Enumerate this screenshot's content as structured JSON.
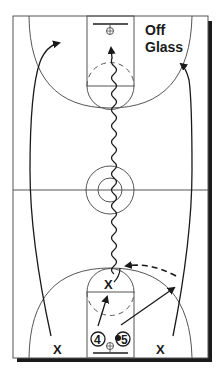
{
  "diagram": {
    "type": "basketball-half-court-drill",
    "title_line1": "Off",
    "title_line2": "Glass",
    "colors": {
      "court_line": "#555555",
      "ink": "#1a1a1a",
      "shadow": "#1a1a1a",
      "background": "#ffffff"
    },
    "players": [
      {
        "id": "x-top-of-key",
        "label": "X",
        "role": "defender/receiver near free-throw line"
      },
      {
        "id": "x-left-wing",
        "label": "X",
        "role": "left wing player"
      },
      {
        "id": "x-right-wing",
        "label": "X",
        "role": "right wing player"
      },
      {
        "id": "player-4",
        "label": "4",
        "role": "rebounder under basket"
      },
      {
        "id": "player-5",
        "label": "5",
        "role": "passer with ball"
      }
    ],
    "paths": [
      {
        "id": "dribble-path",
        "style": "wavy",
        "description": "dribble from bottom key to top basket"
      },
      {
        "id": "left-wing-cut",
        "style": "solid-arrow",
        "description": "left wing sprints up floor"
      },
      {
        "id": "right-wing-cut",
        "style": "solid-arrow",
        "description": "right wing sprints up floor"
      },
      {
        "id": "pass-4-to-x",
        "style": "solid-arrow",
        "description": "4 moves to free-throw area"
      },
      {
        "id": "pass-5-to-wing",
        "style": "solid-arrow",
        "description": "5 outlet toward right wing"
      },
      {
        "id": "pass-dashed",
        "style": "dashed-arrow",
        "description": "pass from wing to X at elbow"
      }
    ]
  }
}
